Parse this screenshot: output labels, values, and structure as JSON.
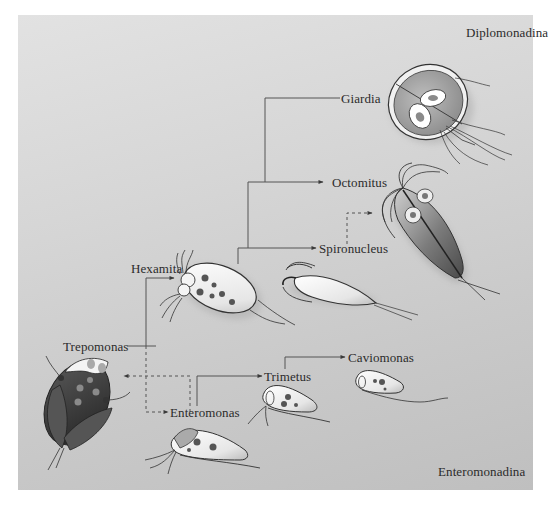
{
  "figure": {
    "type": "phylogenetic-diagram",
    "background_color_top": "#e2e2e2",
    "background_color_bottom": "#bfbfbf",
    "line_color": "#555555"
  },
  "groups": {
    "top_right": "Diplomonadina",
    "bottom_right": "Enteromonadina"
  },
  "taxa": {
    "giardia": "Giardia",
    "octomitus": "Octomitus",
    "spironucleus": "Spironucleus",
    "hexamita": "Hexamita",
    "trepomonas": "Trepomonas",
    "enteromonas": "Enteromonas",
    "trimetus": "Trimetus",
    "caviomonas": "Caviomonas"
  },
  "relationships": [
    {
      "from": "root-diplomonad",
      "to": "Giardia",
      "style": "solid"
    },
    {
      "from": "root-diplomonad",
      "to": "Octomitus",
      "style": "solid-arrow"
    },
    {
      "from": "root-diplomonad",
      "to": "Spironucleus",
      "style": "solid-arrow"
    },
    {
      "from": "Spironucleus",
      "to": "Octomitus-organism",
      "style": "dashed-arrow"
    },
    {
      "from": "Trepomonas",
      "to": "Hexamita",
      "style": "solid-arrow"
    },
    {
      "from": "Trepomonas",
      "to": "Enteromonas",
      "style": "dashed-arrow"
    },
    {
      "from": "Enteromonas",
      "to": "Trepomonas-organism",
      "style": "dashed-arrow"
    },
    {
      "from": "Enteromonas",
      "to": "Trimetus",
      "style": "solid-arrow"
    },
    {
      "from": "Trimetus",
      "to": "Caviomonas",
      "style": "solid-arrow"
    }
  ],
  "organisms": [
    {
      "id": "giardia",
      "label": "Giardia"
    },
    {
      "id": "octomitus",
      "label": "Octomitus"
    },
    {
      "id": "spironucleus",
      "label": "Spironucleus"
    },
    {
      "id": "hexamita",
      "label": "Hexamita"
    },
    {
      "id": "trepomonas",
      "label": "Trepomonas"
    },
    {
      "id": "enteromonas",
      "label": "Enteromonas"
    },
    {
      "id": "trimetus",
      "label": "Trimetus"
    },
    {
      "id": "caviomonas",
      "label": "Caviomonas"
    }
  ]
}
